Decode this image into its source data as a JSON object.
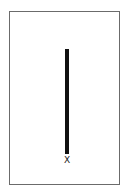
{
  "figure": {
    "label": "X",
    "colors": {
      "frame": "#6b6b6b",
      "bar": "#111111",
      "background": "#ffffff"
    }
  }
}
